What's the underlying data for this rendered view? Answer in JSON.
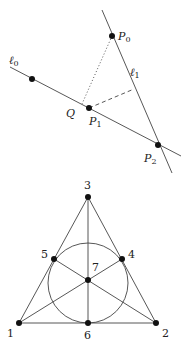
{
  "top_diagram": {
    "lines": {
      "l0": {
        "label": "ℓ",
        "sub": "0",
        "x1": 10,
        "y1": 67,
        "x2": 181,
        "y2": 156
      },
      "l1": {
        "label": "ℓ",
        "sub": "1",
        "x1": 102,
        "y1": 10,
        "x2": 172,
        "y2": 173
      }
    },
    "points": [
      {
        "id": "l0-point",
        "x": 32,
        "y": 79,
        "label": "",
        "sub": ""
      },
      {
        "id": "P0",
        "x": 112,
        "y": 36,
        "label": "P",
        "sub": "0"
      },
      {
        "id": "P1",
        "x": 89,
        "y": 108,
        "label": "P",
        "sub": "1"
      },
      {
        "id": "P2",
        "x": 158,
        "y": 145,
        "label": "P",
        "sub": "2"
      }
    ],
    "q_label": "Q",
    "dotted_segment": {
      "x1": 112,
      "y1": 36,
      "x2": 82,
      "y2": 104
    },
    "dashed_segment": {
      "x1": 89,
      "y1": 108,
      "x2": 134,
      "y2": 89
    }
  },
  "fano_plane": {
    "points": [
      {
        "label": "1",
        "x": 19,
        "y": 323
      },
      {
        "label": "2",
        "x": 156,
        "y": 323
      },
      {
        "label": "3",
        "x": 88,
        "y": 197
      },
      {
        "label": "4",
        "x": 122,
        "y": 259
      },
      {
        "label": "5",
        "x": 54,
        "y": 259
      },
      {
        "label": "6",
        "x": 88,
        "y": 323
      },
      {
        "label": "7",
        "x": 88,
        "y": 280
      }
    ],
    "circle": {
      "cx": 88,
      "cy": 283,
      "r": 40
    }
  }
}
